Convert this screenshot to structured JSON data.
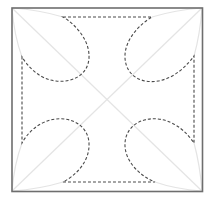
{
  "diagram": {
    "colors": {
      "background": "#ffffff",
      "frame": "#6e6e6e",
      "guides": "#e6e6e6",
      "dashed_contour": "#4a4a4a"
    },
    "frame": {
      "x": 11,
      "y": 7,
      "width": 192,
      "height": 185
    },
    "dash_pattern": "3 2"
  }
}
